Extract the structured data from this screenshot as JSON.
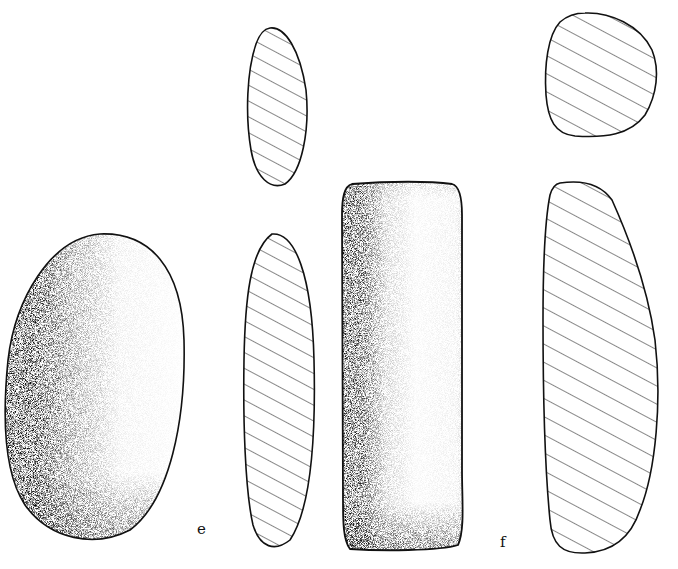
{
  "plate": {
    "type": "archaeological artifact illustration",
    "background_color": "#ffffff",
    "line_color": "#111111",
    "figures": [
      {
        "id": "e",
        "label": "e",
        "description": "stippled oval pebble tool (plan view) with two hatched cross-sections",
        "views": [
          "plan-stippled",
          "section-upper-hatched",
          "section-lower-hatched"
        ]
      },
      {
        "id": "f",
        "label": "f",
        "description": "stippled rectangular ground-stone tool (plan view) with two hatched cross-sections",
        "views": [
          "plan-stippled",
          "section-upper-hatched",
          "section-lower-hatched"
        ]
      }
    ]
  },
  "labels": {
    "e": "e",
    "f": "f"
  }
}
